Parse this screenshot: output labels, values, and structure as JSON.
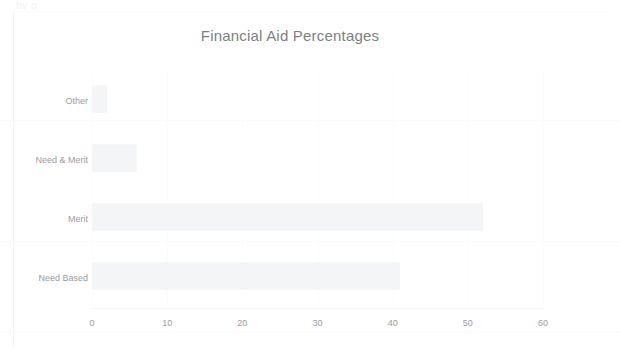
{
  "document": {
    "top_sliver_text": "by g"
  },
  "chart_data": {
    "type": "bar",
    "orientation": "horizontal",
    "title": "Financial Aid Percentages",
    "xlabel": "",
    "ylabel": "",
    "categories": [
      "Need Based",
      "Merit",
      "Need & Merit",
      "Other"
    ],
    "values": [
      41,
      52,
      6,
      2
    ],
    "xlim": [
      0,
      60
    ],
    "xticks": [
      0,
      10,
      20,
      30,
      40,
      50,
      60
    ],
    "xtick_labels": [
      "0",
      "10",
      "20",
      "30",
      "40",
      "50",
      "60"
    ],
    "grid": false,
    "legend": false,
    "bar_color": "#f4f5f6",
    "title_color": "#7d7f83",
    "tick_color": "#9a9ca0",
    "display_order_top_to_bottom": [
      "Other",
      "Need & Merit",
      "Merit",
      "Need Based"
    ]
  }
}
